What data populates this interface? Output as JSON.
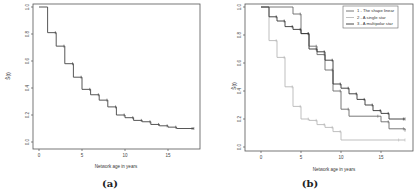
{
  "chart_data": [
    {
      "panel": "(a)",
      "type": "line",
      "step": true,
      "title": "",
      "xlabel": "Network age in years",
      "ylabel": "Ŝ(t)",
      "xlim": [
        0,
        18
      ],
      "ylim": [
        0,
        1
      ],
      "xticks": [
        "0",
        "5",
        "10",
        "15"
      ],
      "yticks": [
        "0.0",
        "0.2",
        "0.4",
        "0.6",
        "0.8",
        "1.0"
      ],
      "grid": false,
      "series": [
        {
          "name": "Survival",
          "color": "#444444",
          "x": [
            0,
            1,
            2,
            3,
            4,
            5,
            6,
            7,
            8,
            9,
            10,
            11,
            12,
            13,
            14,
            15,
            16,
            18
          ],
          "values": [
            1.0,
            0.81,
            0.71,
            0.58,
            0.48,
            0.39,
            0.35,
            0.31,
            0.26,
            0.2,
            0.18,
            0.16,
            0.15,
            0.13,
            0.12,
            0.11,
            0.1,
            0.1
          ]
        }
      ]
    },
    {
      "panel": "(b)",
      "type": "line",
      "step": true,
      "title": "",
      "xlabel": "Network age in years",
      "ylabel": "Ŝ(t)",
      "xlim": [
        0,
        18
      ],
      "ylim": [
        0,
        1
      ],
      "xticks": [
        "0",
        "5",
        "10",
        "15"
      ],
      "yticks": [
        "0.0",
        "0.2",
        "0.4",
        "0.6",
        "0.8",
        "1.0"
      ],
      "grid": false,
      "legend_position": "top-right",
      "series": [
        {
          "name": "1 - The shape linear",
          "color": "#6a6a6a",
          "x": [
            0,
            4,
            5,
            6,
            7,
            8,
            9,
            10,
            11,
            15,
            16,
            18
          ],
          "values": [
            1.0,
            0.95,
            0.81,
            0.72,
            0.66,
            0.55,
            0.4,
            0.27,
            0.22,
            0.18,
            0.13,
            0.12
          ]
        },
        {
          "name": "2 - A single star",
          "color": "#b8b8b8",
          "x": [
            0,
            1,
            2,
            3,
            4,
            5,
            6,
            7,
            8,
            9,
            10,
            18
          ],
          "values": [
            1.0,
            0.76,
            0.64,
            0.43,
            0.29,
            0.2,
            0.19,
            0.16,
            0.14,
            0.11,
            0.05,
            0.05
          ]
        },
        {
          "name": "3 - A multipolar star",
          "color": "#333333",
          "x": [
            0,
            1,
            2,
            3,
            4,
            5,
            6,
            7,
            8,
            9,
            10,
            11,
            12,
            13,
            14,
            15,
            16,
            18
          ],
          "values": [
            1.0,
            0.93,
            0.9,
            0.86,
            0.84,
            0.81,
            0.7,
            0.68,
            0.62,
            0.45,
            0.42,
            0.38,
            0.34,
            0.3,
            0.26,
            0.24,
            0.2,
            0.2
          ]
        }
      ]
    }
  ],
  "panels": {
    "a": {
      "label": "(a)",
      "xlabel": "Network age in years",
      "ylabel": "Ŝ(t)"
    },
    "b": {
      "label": "(b)",
      "xlabel": "Network age in years",
      "ylabel": "Ŝ(t)",
      "legend": [
        "1 - The shape linear",
        "2 - A single star",
        "3 - A multipolar star"
      ]
    }
  }
}
